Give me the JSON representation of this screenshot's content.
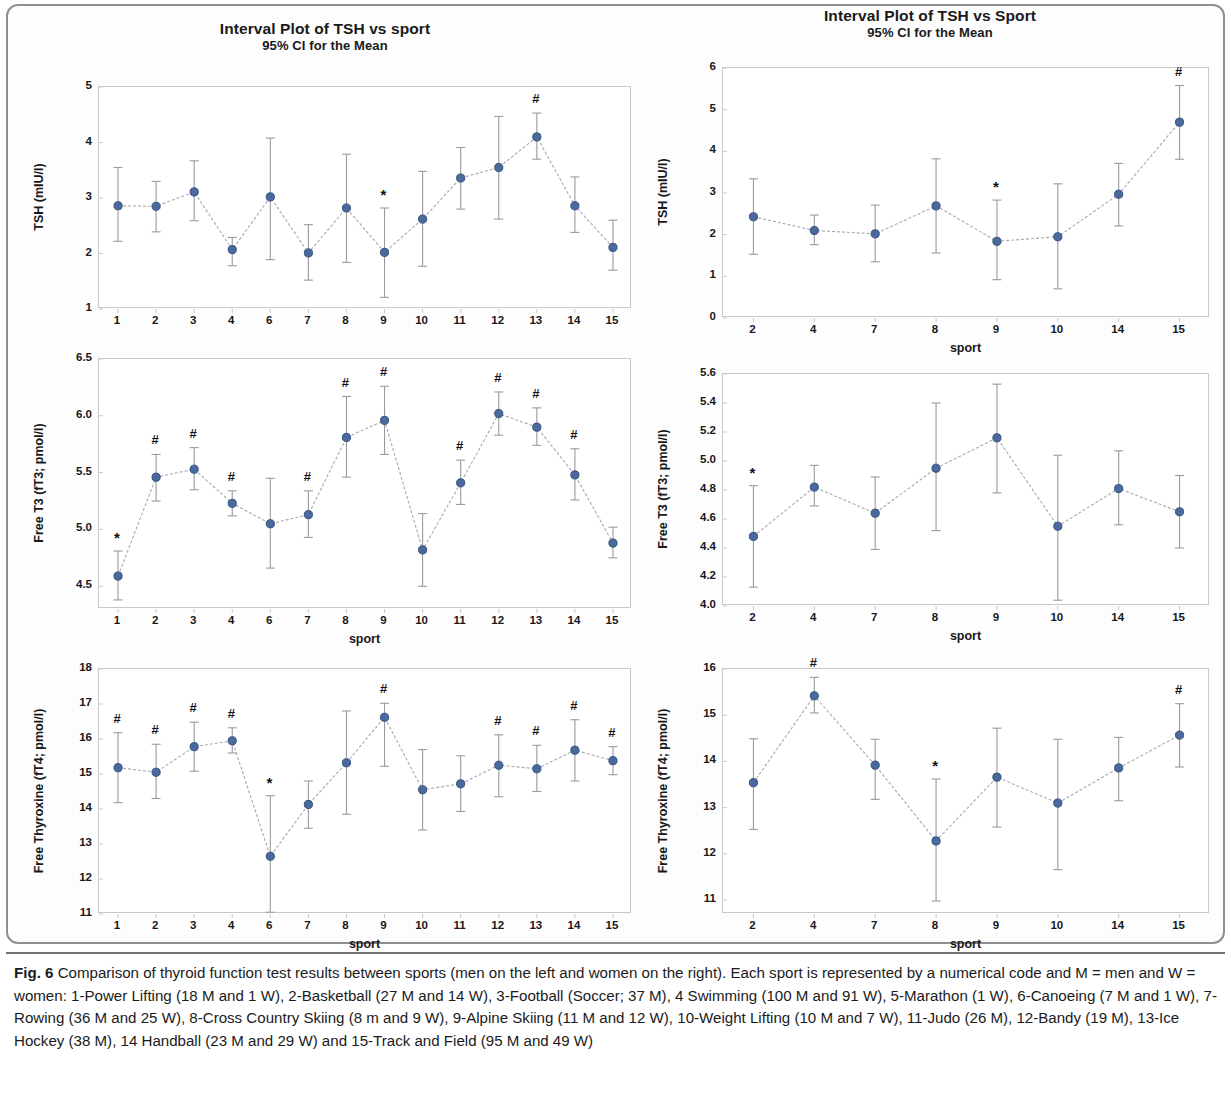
{
  "colors": {
    "marker": "#4a6a9e",
    "marker_edge": "#2f4a75",
    "error_bar": "#9a9aa2",
    "connector": "#a8a8b0",
    "axis": "#c8c9cb",
    "frame": "#8d8f92",
    "text": "#17181a"
  },
  "caption": {
    "label": "Fig. 6",
    "text": "Comparison of thyroid function test results between sports (men on the left and women on the right). Each sport is represented by a numerical code and M = men and W = women: 1-Power Lifting (18 M and 1 W), 2-Basketball (27 M and 14 W), 3-Football (Soccer; 37 M), 4 Swimming (100 M and 91 W), 5-Marathon (1 W), 6-Canoeing (7 M and 1 W), 7-Rowing (36 M and 25 W), 8-Cross Country Skiing (8 m and 9 W), 9-Alpine Skiing (11 M and 12 W), 10-Weight Lifting (10 M and 7 W), 11-Judo (26 M), 12-Bandy (19 M), 13-Ice Hockey (38 M), 14 Handball (23 M and 29 W) and 15-Track and Field (95 M and 49 W)"
  },
  "chart_data": [
    {
      "id": "tsh-men",
      "type": "line",
      "title": "Interval Plot of TSH vs sport",
      "subtitle": "95% CI for the Mean",
      "xlabel": "",
      "ylabel": "TSH (mIU/l)",
      "group": "men",
      "ylim": [
        1,
        5
      ],
      "yticks": [
        1,
        2,
        3,
        4,
        5
      ],
      "ytick_labels": [
        "1",
        "2",
        "3",
        "4",
        "5"
      ],
      "grid": false,
      "categories": [
        "1",
        "2",
        "3",
        "4",
        "6",
        "7",
        "8",
        "9",
        "10",
        "11",
        "12",
        "13",
        "14",
        "15"
      ],
      "values": [
        2.86,
        2.85,
        3.11,
        2.07,
        3.02,
        2.01,
        2.82,
        2.02,
        2.62,
        3.36,
        3.55,
        4.1,
        2.86,
        2.11
      ],
      "ci_lower": [
        2.22,
        2.39,
        2.59,
        1.78,
        1.89,
        1.52,
        1.84,
        1.21,
        1.77,
        2.8,
        2.62,
        3.7,
        2.38,
        1.7
      ],
      "ci_upper": [
        3.55,
        3.3,
        3.67,
        2.29,
        4.08,
        2.52,
        3.79,
        2.82,
        3.48,
        3.91,
        4.47,
        4.53,
        3.38,
        2.6
      ],
      "annotations": [
        {
          "category": "9",
          "symbol": "*"
        },
        {
          "category": "13",
          "symbol": "#"
        }
      ]
    },
    {
      "id": "tsh-women",
      "type": "line",
      "title": "Interval Plot of TSH vs Sport",
      "subtitle": "95% CI for the Mean",
      "xlabel": "sport",
      "ylabel": "TSH (mIU/l)",
      "group": "women",
      "ylim": [
        0,
        6
      ],
      "yticks": [
        0,
        1,
        2,
        3,
        4,
        5,
        6
      ],
      "ytick_labels": [
        "0",
        "1",
        "2",
        "3",
        "4",
        "5",
        "6"
      ],
      "grid": false,
      "categories": [
        "2",
        "4",
        "7",
        "8",
        "9",
        "10",
        "14",
        "15"
      ],
      "values": [
        2.43,
        2.1,
        2.02,
        2.69,
        1.84,
        1.95,
        2.97,
        4.7
      ],
      "ci_lower": [
        1.53,
        1.76,
        1.35,
        1.56,
        0.92,
        0.7,
        2.21,
        3.81
      ],
      "ci_upper": [
        3.34,
        2.47,
        2.71,
        3.82,
        2.83,
        3.22,
        3.71,
        5.58
      ],
      "annotations": [
        {
          "category": "9",
          "symbol": "*"
        },
        {
          "category": "15",
          "symbol": "#"
        }
      ]
    },
    {
      "id": "ft3-men",
      "type": "line",
      "title": "",
      "subtitle": "",
      "xlabel": "sport",
      "ylabel": "Free T3 (fT3; pmol/l)",
      "group": "men",
      "ylim": [
        4.3,
        6.5
      ],
      "yticks": [
        4.5,
        5.0,
        5.5,
        6.0,
        6.5
      ],
      "ytick_labels": [
        "4.5",
        "5.0",
        "5.5",
        "6.0",
        "6.5"
      ],
      "grid": false,
      "categories": [
        "1",
        "2",
        "3",
        "4",
        "6",
        "7",
        "8",
        "9",
        "10",
        "11",
        "12",
        "13",
        "14",
        "15"
      ],
      "values": [
        4.59,
        5.46,
        5.53,
        5.23,
        5.05,
        5.13,
        5.81,
        5.96,
        4.82,
        5.41,
        6.02,
        5.9,
        5.48,
        4.88
      ],
      "ci_lower": [
        4.38,
        5.25,
        5.35,
        5.12,
        4.66,
        4.93,
        5.46,
        5.66,
        4.5,
        5.22,
        5.83,
        5.74,
        5.26,
        4.75
      ],
      "ci_upper": [
        4.81,
        5.66,
        5.72,
        5.34,
        5.45,
        5.34,
        6.17,
        6.26,
        5.14,
        5.61,
        6.21,
        6.07,
        5.71,
        5.02
      ],
      "annotations": [
        {
          "category": "1",
          "symbol": "*"
        },
        {
          "category": "2",
          "symbol": "#"
        },
        {
          "category": "3",
          "symbol": "#"
        },
        {
          "category": "4",
          "symbol": "#"
        },
        {
          "category": "7",
          "symbol": "#"
        },
        {
          "category": "8",
          "symbol": "#"
        },
        {
          "category": "9",
          "symbol": "#"
        },
        {
          "category": "11",
          "symbol": "#"
        },
        {
          "category": "12",
          "symbol": "#"
        },
        {
          "category": "13",
          "symbol": "#"
        },
        {
          "category": "14",
          "symbol": "#"
        }
      ]
    },
    {
      "id": "ft3-women",
      "type": "line",
      "title": "",
      "subtitle": "",
      "xlabel": "sport",
      "ylabel": "Free T3 (fT3; pmol/l)",
      "group": "women",
      "ylim": [
        4.0,
        5.6
      ],
      "yticks": [
        4.0,
        4.2,
        4.4,
        4.6,
        4.8,
        5.0,
        5.2,
        5.4,
        5.6
      ],
      "ytick_labels": [
        "4.0",
        "4.2",
        "4.4",
        "4.6",
        "4.8",
        "5.0",
        "5.2",
        "5.4",
        "5.6"
      ],
      "grid": false,
      "categories": [
        "2",
        "4",
        "7",
        "8",
        "9",
        "10",
        "14",
        "15"
      ],
      "values": [
        4.48,
        4.82,
        4.64,
        4.95,
        5.16,
        4.55,
        4.81,
        4.65
      ],
      "ci_lower": [
        4.13,
        4.69,
        4.39,
        4.52,
        4.78,
        4.04,
        4.56,
        4.4
      ],
      "ci_upper": [
        4.83,
        4.97,
        4.89,
        5.4,
        5.53,
        5.04,
        5.07,
        4.9
      ],
      "annotations": [
        {
          "category": "2",
          "symbol": "*"
        }
      ]
    },
    {
      "id": "ft4-men",
      "type": "line",
      "title": "",
      "subtitle": "",
      "xlabel": "sport",
      "ylabel": "Free Thyroxine (fT4; pmol/l)",
      "group": "men",
      "ylim": [
        11,
        18
      ],
      "yticks": [
        11,
        12,
        13,
        14,
        15,
        16,
        17,
        18
      ],
      "ytick_labels": [
        "11",
        "12",
        "13",
        "14",
        "15",
        "16",
        "17",
        "18"
      ],
      "grid": false,
      "categories": [
        "1",
        "2",
        "3",
        "4",
        "6",
        "7",
        "8",
        "9",
        "10",
        "11",
        "12",
        "13",
        "14",
        "15"
      ],
      "values": [
        15.18,
        15.05,
        15.78,
        15.95,
        12.65,
        14.13,
        15.32,
        16.62,
        14.55,
        14.72,
        15.25,
        15.15,
        15.68,
        15.38
      ],
      "ci_lower": [
        14.18,
        14.3,
        15.08,
        15.6,
        11.05,
        13.45,
        13.85,
        15.22,
        13.4,
        13.93,
        14.35,
        14.5,
        14.8,
        14.98
      ],
      "ci_upper": [
        16.18,
        15.85,
        16.48,
        16.32,
        14.38,
        14.8,
        16.8,
        17.02,
        15.7,
        15.52,
        16.12,
        15.82,
        16.55,
        15.78
      ],
      "annotations": [
        {
          "category": "1",
          "symbol": "#"
        },
        {
          "category": "2",
          "symbol": "#"
        },
        {
          "category": "3",
          "symbol": "#"
        },
        {
          "category": "4",
          "symbol": "#"
        },
        {
          "category": "6",
          "symbol": "*"
        },
        {
          "category": "9",
          "symbol": "#"
        },
        {
          "category": "12",
          "symbol": "#"
        },
        {
          "category": "13",
          "symbol": "#"
        },
        {
          "category": "14",
          "symbol": "#"
        },
        {
          "category": "15",
          "symbol": "#"
        }
      ]
    },
    {
      "id": "ft4-women",
      "type": "line",
      "title": "",
      "subtitle": "",
      "xlabel": "sport",
      "ylabel": "Free Thyroxine (fT4; pmol/l)",
      "group": "women",
      "ylim": [
        10.7,
        16
      ],
      "yticks": [
        11,
        12,
        13,
        14,
        15,
        16
      ],
      "ytick_labels": [
        "11",
        "12",
        "13",
        "14",
        "15",
        "16"
      ],
      "grid": false,
      "categories": [
        "2",
        "4",
        "7",
        "8",
        "9",
        "10",
        "14",
        "15"
      ],
      "values": [
        13.54,
        15.42,
        13.92,
        12.28,
        13.66,
        13.1,
        13.86,
        14.57
      ],
      "ci_lower": [
        12.53,
        15.05,
        13.18,
        10.98,
        12.58,
        11.66,
        13.15,
        13.88
      ],
      "ci_upper": [
        14.49,
        15.82,
        14.48,
        13.62,
        14.72,
        14.48,
        14.52,
        15.25
      ],
      "annotations": [
        {
          "category": "4",
          "symbol": "#"
        },
        {
          "category": "8",
          "symbol": "*"
        },
        {
          "category": "15",
          "symbol": "#"
        }
      ]
    }
  ],
  "panel_layout": [
    {
      "id": "tsh-men",
      "left": 20,
      "top": 18,
      "width": 610,
      "height": 330,
      "plot_left": 78,
      "plot_top": 68,
      "plot_width": 533,
      "plot_height": 222
    },
    {
      "id": "tsh-women",
      "left": 640,
      "top": 5,
      "width": 580,
      "height": 340,
      "plot_left": 82,
      "plot_top": 62,
      "plot_width": 487,
      "plot_height": 250
    },
    {
      "id": "ft3-men",
      "left": 20,
      "top": 350,
      "width": 610,
      "height": 300,
      "plot_left": 78,
      "plot_top": 8,
      "plot_width": 533,
      "plot_height": 250
    },
    {
      "id": "ft3-women",
      "left": 640,
      "top": 355,
      "width": 580,
      "height": 300,
      "plot_left": 82,
      "plot_top": 18,
      "plot_width": 487,
      "plot_height": 232
    },
    {
      "id": "ft4-men",
      "left": 20,
      "top": 655,
      "width": 610,
      "height": 300,
      "plot_left": 78,
      "plot_top": 13,
      "plot_width": 533,
      "plot_height": 245
    },
    {
      "id": "ft4-women",
      "left": 640,
      "top": 655,
      "width": 580,
      "height": 300,
      "plot_left": 82,
      "plot_top": 13,
      "plot_width": 487,
      "plot_height": 245
    }
  ]
}
